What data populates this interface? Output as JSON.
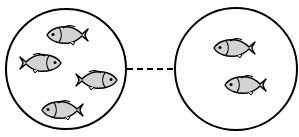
{
  "diagram": {
    "colors": {
      "stroke": "#000000",
      "fish_fill": "#d3d3d3",
      "background": "#ffffff"
    },
    "groups": [
      {
        "name": "left-group",
        "fish_count": 4
      },
      {
        "name": "right-group",
        "fish_count": 2
      }
    ],
    "connector": {
      "style": "dashed"
    }
  }
}
